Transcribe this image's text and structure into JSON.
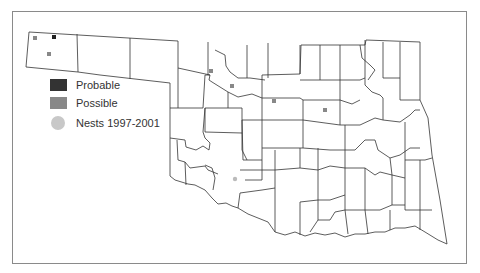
{
  "map": {
    "region": "Oklahoma counties",
    "frame_color": "#8a8a8a",
    "county_line_color": "#333333",
    "markers": [
      {
        "type": "possible",
        "x": 35,
        "y": 38
      },
      {
        "type": "probable",
        "x": 54,
        "y": 37
      },
      {
        "type": "possible",
        "x": 49,
        "y": 54
      },
      {
        "type": "possible",
        "x": 211,
        "y": 71
      },
      {
        "type": "possible",
        "x": 232,
        "y": 86
      },
      {
        "type": "possible",
        "x": 274,
        "y": 101
      },
      {
        "type": "possible",
        "x": 325,
        "y": 110
      },
      {
        "type": "nest",
        "x": 235,
        "y": 179
      }
    ]
  },
  "legend": {
    "items": [
      {
        "label": "Probable",
        "color": "#333333",
        "shape": "square"
      },
      {
        "label": "Possible",
        "color": "#888888",
        "shape": "square"
      },
      {
        "label": "Nests 1997-2001",
        "color": "#c8c8c8",
        "shape": "circle"
      }
    ]
  }
}
